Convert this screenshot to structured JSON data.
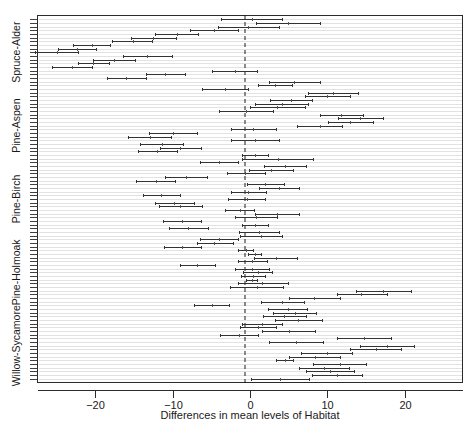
{
  "chart_data": {
    "type": "line",
    "title": "",
    "subtitle": "",
    "xlabel": "Differences in mean levels of Habitat",
    "ylabel": "",
    "xlim": [
      -27.5,
      27.5
    ],
    "xticks": [
      -20,
      -10,
      0,
      10,
      20
    ],
    "xticklabels": [
      "−20",
      "−10",
      "0",
      "10",
      "20"
    ],
    "grid": false,
    "legend": null,
    "reference_line": {
      "value": 0,
      "style": "dashed",
      "color": "#1a1a1a"
    },
    "group_labels": [
      "Spruce-Alder",
      "Pine-Aspen",
      "Pine-Birch",
      "Pine-Holmoak",
      "Willow-Sycamore"
    ],
    "series": [
      {
        "name": "Confidence intervals",
        "intervals": [
          {
            "lower": 0.1,
            "center": 3.9,
            "upper": 7.6
          },
          {
            "lower": 8.0,
            "center": 11.2,
            "upper": 14.5
          },
          {
            "lower": 7.3,
            "center": 10.4,
            "upper": 13.5
          },
          {
            "lower": 6.4,
            "center": 9.6,
            "upper": 12.8
          },
          {
            "lower": 8.1,
            "center": 11.6,
            "upper": 15.0
          },
          {
            "lower": 3.4,
            "center": 4.5,
            "upper": 5.6
          },
          {
            "lower": 5.1,
            "center": 8.4,
            "upper": 11.7
          },
          {
            "lower": 6.6,
            "center": 9.9,
            "upper": 13.2
          },
          {
            "lower": 13.0,
            "center": 16.3,
            "upper": 19.6
          },
          {
            "lower": 14.2,
            "center": 17.7,
            "upper": 21.2
          },
          {
            "lower": 2.5,
            "center": 5.9,
            "upper": 9.4
          },
          {
            "lower": 11.3,
            "center": 14.8,
            "upper": 18.2
          },
          {
            "lower": -3.9,
            "center": -1.4,
            "upper": 1.0
          },
          {
            "lower": 1.6,
            "center": 5.0,
            "upper": 8.4
          },
          {
            "lower": -1.3,
            "center": 1.0,
            "upper": 3.3
          },
          {
            "lower": -1.0,
            "center": 1.6,
            "upper": 4.2
          },
          {
            "lower": 3.2,
            "center": 6.2,
            "upper": 9.3
          },
          {
            "lower": 1.7,
            "center": 4.4,
            "upper": 7.2
          },
          {
            "lower": 3.0,
            "center": 5.8,
            "upper": 8.5
          },
          {
            "lower": 2.3,
            "center": 4.9,
            "upper": 7.4
          },
          {
            "lower": -7.2,
            "center": -4.9,
            "upper": -2.7
          },
          {
            "lower": 1.4,
            "center": 4.2,
            "upper": 7.0
          },
          {
            "lower": 5.0,
            "center": 8.3,
            "upper": 11.6
          },
          {
            "lower": 11.2,
            "center": 14.4,
            "upper": 17.7
          },
          {
            "lower": 13.7,
            "center": 17.2,
            "upper": 20.8
          },
          {
            "lower": -2.6,
            "center": 0.9,
            "upper": 4.3
          },
          {
            "lower": -1.6,
            "center": 1.6,
            "upper": 4.9
          },
          {
            "lower": -0.5,
            "center": 0.2,
            "upper": 0.9
          },
          {
            "lower": -1.2,
            "center": 0.4,
            "upper": 2.0
          },
          {
            "lower": -0.9,
            "center": 1.0,
            "upper": 2.9
          },
          {
            "lower": -2.0,
            "center": 0.3,
            "upper": 2.5
          },
          {
            "lower": -9.1,
            "center": -6.8,
            "upper": -4.5
          },
          {
            "lower": -1.6,
            "center": 0.3,
            "upper": 2.2
          },
          {
            "lower": 0.5,
            "center": 3.3,
            "upper": 6.1
          },
          {
            "lower": -0.2,
            "center": 0.6,
            "upper": 1.4
          },
          {
            "lower": -1.5,
            "center": -0.5,
            "upper": 0.4
          },
          {
            "lower": -11.1,
            "center": -8.8,
            "upper": -6.4
          },
          {
            "lower": -6.9,
            "center": -4.6,
            "upper": -2.2
          },
          {
            "lower": -6.5,
            "center": -4.0,
            "upper": -1.5
          },
          {
            "lower": -1.3,
            "center": 1.4,
            "upper": 4.1
          },
          {
            "lower": -1.4,
            "center": 1.2,
            "upper": 3.8
          },
          {
            "lower": -10.5,
            "center": -8.0,
            "upper": -5.4
          },
          {
            "lower": -1.0,
            "center": 0.7,
            "upper": 2.3
          },
          {
            "lower": -11.2,
            "center": -8.8,
            "upper": -6.4
          },
          {
            "lower": -2.0,
            "center": 0.8,
            "upper": 3.5
          },
          {
            "lower": 0.7,
            "center": 3.5,
            "upper": 6.3
          },
          {
            "lower": -3.2,
            "center": -1.3,
            "upper": 0.5
          },
          {
            "lower": -11.8,
            "center": -9.0,
            "upper": -6.2
          },
          {
            "lower": -12.3,
            "center": -9.8,
            "upper": -7.3
          },
          {
            "lower": -2.8,
            "center": -0.4,
            "upper": 2.0
          },
          {
            "lower": -13.9,
            "center": -11.5,
            "upper": -9.1
          },
          {
            "lower": -2.5,
            "center": -0.2,
            "upper": 2.1
          },
          {
            "lower": 1.2,
            "center": 3.8,
            "upper": 6.4
          },
          {
            "lower": -0.4,
            "center": 2.0,
            "upper": 4.4
          },
          {
            "lower": -14.7,
            "center": -12.2,
            "upper": -9.7
          },
          {
            "lower": -11.0,
            "center": -8.3,
            "upper": -5.6
          },
          {
            "lower": -3.0,
            "center": -0.6,
            "upper": 1.9
          },
          {
            "lower": -0.1,
            "center": 2.7,
            "upper": 5.5
          },
          {
            "lower": 1.8,
            "center": 4.5,
            "upper": 7.3
          },
          {
            "lower": -6.5,
            "center": -4.0,
            "upper": -1.6
          },
          {
            "lower": -1.1,
            "center": 3.6,
            "upper": 8.2
          },
          {
            "lower": -1.1,
            "center": 0.6,
            "upper": 2.3
          },
          {
            "lower": -14.5,
            "center": -12.0,
            "upper": -9.4
          },
          {
            "lower": -11.7,
            "center": -9.0,
            "upper": -6.3
          },
          {
            "lower": -14.2,
            "center": -11.4,
            "upper": -8.7
          },
          {
            "lower": -2.5,
            "center": 0.6,
            "upper": 3.7
          },
          {
            "lower": -15.8,
            "center": -13.0,
            "upper": -10.2
          },
          {
            "lower": -13.1,
            "center": -10.0,
            "upper": -6.9
          },
          {
            "lower": -2.5,
            "center": 0.4,
            "upper": 3.3
          },
          {
            "lower": 6.1,
            "center": 9.0,
            "upper": 11.9
          },
          {
            "lower": 10.1,
            "center": 13.0,
            "upper": 15.9
          },
          {
            "lower": 11.4,
            "center": 14.3,
            "upper": 17.2
          },
          {
            "lower": 9.0,
            "center": 11.8,
            "upper": 14.6
          },
          {
            "lower": -4.0,
            "center": -0.5,
            "upper": 3.0
          },
          {
            "lower": 0.0,
            "center": 3.5,
            "upper": 7.1
          },
          {
            "lower": 0.7,
            "center": 4.1,
            "upper": 7.5
          },
          {
            "lower": 2.6,
            "center": 5.3,
            "upper": 8.0
          },
          {
            "lower": 7.1,
            "center": 10.0,
            "upper": 12.9
          },
          {
            "lower": 7.5,
            "center": 10.8,
            "upper": 14.0
          },
          {
            "lower": -6.2,
            "center": -3.2,
            "upper": -0.3
          },
          {
            "lower": 1.0,
            "center": 3.2,
            "upper": 5.4
          },
          {
            "lower": 2.4,
            "center": 5.7,
            "upper": 9.0
          },
          {
            "lower": -18.5,
            "center": -16.0,
            "upper": -13.4
          },
          {
            "lower": -13.5,
            "center": -11.0,
            "upper": -8.4
          },
          {
            "lower": -4.9,
            "center": -2.0,
            "upper": 0.9
          },
          {
            "lower": -25.6,
            "center": -23.0,
            "upper": -20.4
          },
          {
            "lower": -22.2,
            "center": -20.3,
            "upper": -18.3
          },
          {
            "lower": -20.3,
            "center": -17.6,
            "upper": -14.9
          },
          {
            "lower": -16.5,
            "center": -13.3,
            "upper": -10.1
          },
          {
            "lower": -27.8,
            "center": -25.0,
            "upper": -22.2
          },
          {
            "lower": -24.9,
            "center": -22.4,
            "upper": -19.9
          },
          {
            "lower": -22.9,
            "center": -20.5,
            "upper": -18.1
          },
          {
            "lower": -17.8,
            "center": -15.2,
            "upper": -12.7
          },
          {
            "lower": -15.4,
            "center": -12.5,
            "upper": -9.6
          },
          {
            "lower": -12.3,
            "center": -9.5,
            "upper": -6.7
          },
          {
            "lower": -7.8,
            "center": -4.7,
            "upper": -1.6
          },
          {
            "lower": -4.1,
            "center": -0.2,
            "upper": 3.8
          },
          {
            "lower": 0.8,
            "center": 4.9,
            "upper": 9.0
          },
          {
            "lower": -3.8,
            "center": 0.2,
            "upper": 4.2
          }
        ]
      }
    ]
  }
}
